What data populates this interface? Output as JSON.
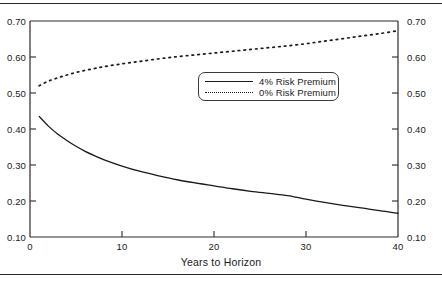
{
  "chart_data": {
    "type": "line",
    "title": "",
    "subtitle": "",
    "xlabel": "Years to Horizon",
    "ylabel": "",
    "xlim": [
      0,
      40
    ],
    "ylim": [
      0.1,
      0.7
    ],
    "xticks": [
      "0",
      "10",
      "20",
      "30",
      "40"
    ],
    "xtick_values": [
      0,
      10,
      20,
      30,
      40
    ],
    "yticks": [
      "0.10",
      "0.20",
      "0.30",
      "0.40",
      "0.50",
      "0.60",
      "0.70"
    ],
    "ytick_values": [
      0.1,
      0.2,
      0.3,
      0.4,
      0.5,
      0.6,
      0.7
    ],
    "right_axis_yticks": [
      "0.10",
      "0.20",
      "0.30",
      "0.40",
      "0.50",
      "0.60",
      "0.70"
    ],
    "grid": false,
    "legend_position": "upper-center",
    "legend_entries": [
      "4% Risk Premium",
      "0% Risk Premium"
    ],
    "series": [
      {
        "name": "4% Risk Premium",
        "style": "solid",
        "color": "#1a1a1a",
        "x": [
          1,
          2,
          3,
          4,
          5,
          6,
          7,
          8,
          10,
          12,
          14,
          16,
          18,
          20,
          22,
          24,
          26,
          28,
          30,
          32,
          34,
          36,
          38,
          40
        ],
        "values": [
          0.435,
          0.408,
          0.386,
          0.368,
          0.352,
          0.338,
          0.326,
          0.315,
          0.297,
          0.282,
          0.27,
          0.259,
          0.25,
          0.242,
          0.234,
          0.227,
          0.221,
          0.215,
          0.205,
          0.196,
          0.188,
          0.181,
          0.173,
          0.166
        ]
      },
      {
        "name": "0% Risk Premium",
        "style": "dotted",
        "color": "#1a1a1a",
        "x": [
          1,
          2,
          3,
          4,
          5,
          6,
          7,
          8,
          10,
          12,
          14,
          16,
          18,
          20,
          22,
          24,
          26,
          28,
          30,
          32,
          34,
          36,
          38,
          40
        ],
        "values": [
          0.52,
          0.533,
          0.542,
          0.55,
          0.557,
          0.563,
          0.568,
          0.573,
          0.581,
          0.588,
          0.595,
          0.601,
          0.606,
          0.611,
          0.616,
          0.621,
          0.626,
          0.631,
          0.637,
          0.644,
          0.651,
          0.658,
          0.665,
          0.673
        ]
      }
    ]
  },
  "axes": {
    "x_title": "Years to Horizon"
  }
}
